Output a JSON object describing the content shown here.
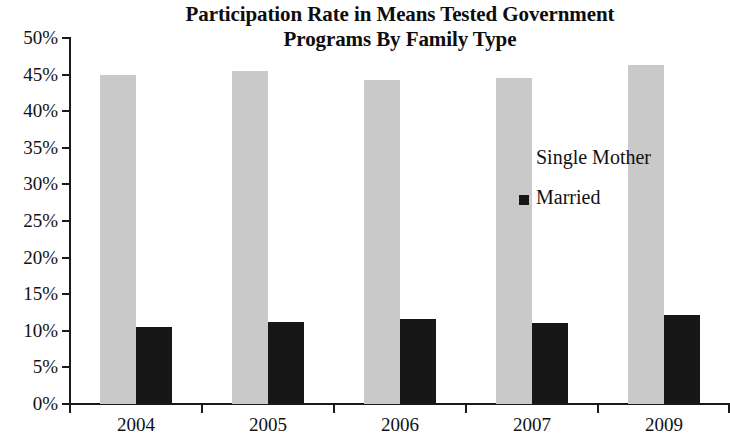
{
  "chart_data": {
    "type": "bar",
    "title": "Participation Rate in Means Tested Government Programs By Family Type",
    "title_lines": [
      "Participation Rate in Means Tested Government",
      "Programs By Family Type"
    ],
    "xlabel": "",
    "ylabel": "",
    "categories": [
      "2004",
      "2005",
      "2006",
      "2007",
      "2009"
    ],
    "series": [
      {
        "name": "Single Mother",
        "color": "#c9c9c9",
        "values": [
          45.0,
          45.5,
          44.3,
          44.6,
          46.3
        ]
      },
      {
        "name": "Married",
        "color": "#171717",
        "values": [
          10.5,
          11.2,
          11.6,
          11.1,
          12.2
        ]
      }
    ],
    "ylim": [
      0,
      50
    ],
    "ytick_values": [
      0,
      5,
      10,
      15,
      20,
      25,
      30,
      35,
      40,
      45,
      50
    ],
    "ytick_labels": [
      "0%",
      "5%",
      "10%",
      "15%",
      "20%",
      "25%",
      "30%",
      "35%",
      "40%",
      "45%",
      "50%"
    ],
    "grid": false,
    "legend_position": "center-right",
    "legend_entries": [
      "Single Mother",
      "Married"
    ]
  }
}
